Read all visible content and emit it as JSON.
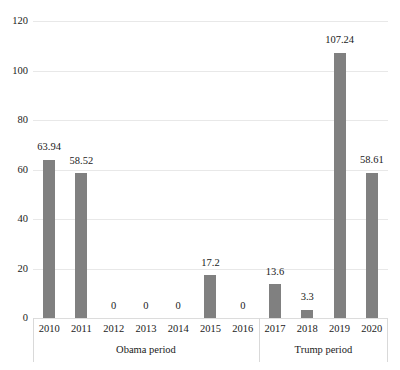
{
  "chart_data": {
    "type": "bar",
    "title": "",
    "subtitle": "",
    "xlabel": "",
    "ylabel": "",
    "ylim": [
      0,
      120
    ],
    "ytick_step": 20,
    "yticks": [
      "0",
      "20",
      "40",
      "60",
      "80",
      "100",
      "120"
    ],
    "grid": true,
    "legend": false,
    "legend_position": "none",
    "categories": [
      "2010",
      "2011",
      "2012",
      "2013",
      "2014",
      "2015",
      "2016",
      "2017",
      "2018",
      "2019",
      "2020"
    ],
    "values": [
      63.94,
      58.52,
      0,
      0,
      0,
      17.2,
      0,
      13.6,
      3.3,
      107.24,
      58.61
    ],
    "point_labels": [
      "63.94",
      "58.52",
      "0",
      "0",
      "0",
      "17.2",
      "0",
      "13.6",
      "3.3",
      "107.24",
      "58.61"
    ],
    "bar_color": "#808080",
    "gridline_color": "#e8e8e8",
    "groups": [
      {
        "label": "Obama period",
        "categories": [
          "2010",
          "2011",
          "2012",
          "2013",
          "2014",
          "2015",
          "2016"
        ]
      },
      {
        "label": "Trump period",
        "categories": [
          "2017",
          "2018",
          "2019",
          "2020"
        ]
      }
    ]
  }
}
